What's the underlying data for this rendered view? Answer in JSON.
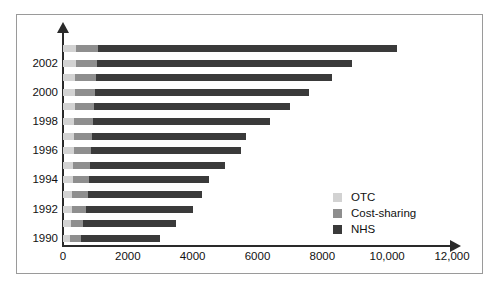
{
  "chart_data": {
    "type": "bar",
    "orientation": "horizontal",
    "stacked": true,
    "title": "",
    "xlabel": "",
    "ylabel": "",
    "xlim": [
      0,
      12000
    ],
    "grid": false,
    "legend_position": "inside-bottom-right",
    "x_ticks": [
      "0",
      "2000",
      "4000",
      "6000",
      "8000",
      "10,000",
      "12,000"
    ],
    "x_tick_values": [
      0,
      2000,
      4000,
      6000,
      8000,
      10000,
      12000
    ],
    "categories": [
      "1990",
      "1991",
      "1992",
      "1993",
      "1994",
      "1995",
      "1996",
      "1997",
      "1998",
      "1999",
      "2000",
      "2001",
      "2002",
      "2003"
    ],
    "y_tick_labels": [
      "1990",
      "1992",
      "1994",
      "1996",
      "1998",
      "2000",
      "2002"
    ],
    "series": [
      {
        "name": "OTC",
        "color": "#d2d2d2",
        "values": [
          220,
          250,
          270,
          290,
          300,
          320,
          330,
          340,
          350,
          360,
          370,
          380,
          390,
          400
        ]
      },
      {
        "name": "Cost-sharing",
        "color": "#8e8e8e",
        "values": [
          330,
          380,
          430,
          480,
          500,
          520,
          540,
          560,
          580,
          600,
          620,
          640,
          660,
          680
        ]
      },
      {
        "name": "NHS",
        "color": "#3a3a3a",
        "values": [
          2450,
          2870,
          3300,
          3530,
          3700,
          4160,
          4630,
          4740,
          5470,
          6040,
          6610,
          7280,
          7850,
          9220
        ]
      }
    ],
    "totals": [
      3000,
      3500,
      4000,
      4300,
      4500,
      5000,
      5500,
      5640,
      6400,
      7000,
      7600,
      8300,
      8900,
      10300
    ],
    "legend": [
      {
        "label": "OTC",
        "color": "#d2d2d2"
      },
      {
        "label": "Cost-sharing",
        "color": "#8e8e8e"
      },
      {
        "label": "NHS",
        "color": "#3a3a3a"
      }
    ]
  }
}
